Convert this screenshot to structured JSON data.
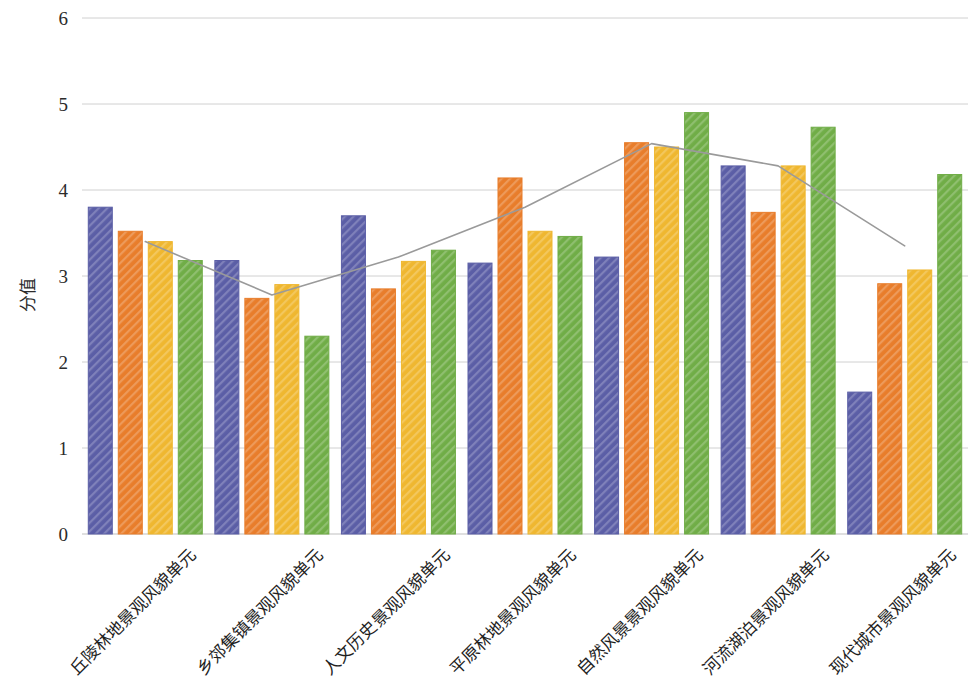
{
  "chart_data": {
    "type": "bar",
    "title": "",
    "subtitle": "",
    "xlabel": "",
    "ylabel": "分值",
    "ylim": [
      0,
      6
    ],
    "yticks": [
      0,
      1,
      2,
      3,
      4,
      5,
      6
    ],
    "ytick_labels": [
      "0",
      "1",
      "2",
      "3",
      "4",
      "5",
      "6"
    ],
    "grid": true,
    "legend": "none",
    "categories": [
      "丘陵林地景观风貌单元",
      "乡郊集镇景观风貌单元",
      "人文历史景观风貌单元",
      "平原林地景观风貌单元",
      "自然风景景观风貌单元",
      "河流湖泊景观风貌单元",
      "现代城市景观风貌单元"
    ],
    "series": [
      {
        "name": "series-1",
        "color": "#5B5EA6",
        "type": "bar",
        "values": [
          3.8,
          3.18,
          3.7,
          3.15,
          3.22,
          4.28,
          1.65
        ]
      },
      {
        "name": "series-2",
        "color": "#E87D2B",
        "type": "bar",
        "values": [
          3.52,
          2.74,
          2.85,
          4.14,
          4.55,
          3.74,
          2.91
        ]
      },
      {
        "name": "series-3",
        "color": "#EFB730",
        "type": "bar",
        "values": [
          3.4,
          2.9,
          3.17,
          3.52,
          4.5,
          4.28,
          3.07
        ]
      },
      {
        "name": "series-4",
        "color": "#70AD47",
        "type": "bar",
        "values": [
          3.18,
          2.3,
          3.3,
          3.46,
          4.9,
          4.73,
          4.18
        ]
      },
      {
        "name": "series-5",
        "color": "#9A9A9A",
        "type": "line",
        "values": [
          3.4,
          2.78,
          3.22,
          3.8,
          4.54,
          4.28,
          3.35
        ]
      }
    ]
  },
  "axis": {
    "y_title": "分值"
  }
}
